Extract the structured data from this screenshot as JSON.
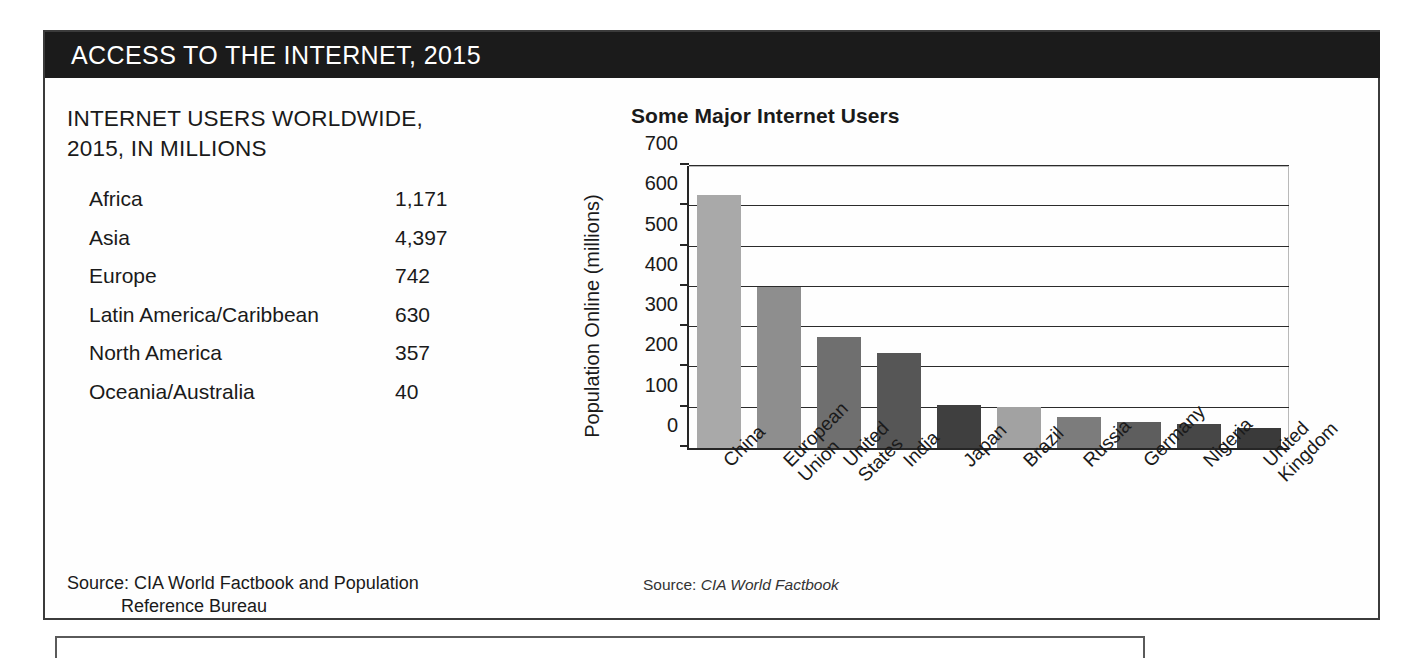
{
  "header": {
    "title": "ACCESS TO THE INTERNET, 2015"
  },
  "table": {
    "title": "INTERNET USERS WORLDWIDE, 2015, IN MILLIONS",
    "rows": [
      {
        "region": "Africa",
        "value": "1,171"
      },
      {
        "region": "Asia",
        "value": "4,397"
      },
      {
        "region": "Europe",
        "value": "742"
      },
      {
        "region": "Latin America/Caribbean",
        "value": "630"
      },
      {
        "region": "North America",
        "value": "357"
      },
      {
        "region": "Oceania/Australia",
        "value": "40"
      }
    ],
    "source_line1": "Source: CIA World Factbook and Population",
    "source_line2": "Reference Bureau"
  },
  "chart_source": {
    "prefix": "Source: ",
    "title": "CIA World Factbook"
  },
  "chart_data": {
    "type": "bar",
    "title": "Some Major Internet Users",
    "xlabel": "",
    "ylabel": "Population Online (millions)",
    "ylim": [
      0,
      700
    ],
    "yticks": [
      0,
      100,
      200,
      300,
      400,
      500,
      600,
      700
    ],
    "ytick_labels": [
      "0",
      "100",
      "200",
      "300",
      "400",
      "500",
      "600",
      "700"
    ],
    "grid": true,
    "legend": "none",
    "categories": [
      "China",
      "European\nUnion",
      "United\nStates",
      "India",
      "Japan",
      "Brazil",
      "Russia",
      "Germany",
      "Nigeria",
      "United\nKingdom"
    ],
    "values": [
      627,
      400,
      275,
      235,
      107,
      103,
      78,
      65,
      60,
      50
    ],
    "bar_colors": [
      "#a9a9a9",
      "#8e8e8e",
      "#6f6f6f",
      "#565656",
      "#3f3f3f",
      "#a2a2a2",
      "#7c7c7c",
      "#5e5e5e",
      "#474747",
      "#3a3a3a"
    ]
  },
  "colors": {
    "header_bg": "#1b1b1b",
    "header_text": "#ffffff",
    "box_border": "#3b3b3b",
    "gridline": "#2b2b2b",
    "axis": "#262626"
  }
}
